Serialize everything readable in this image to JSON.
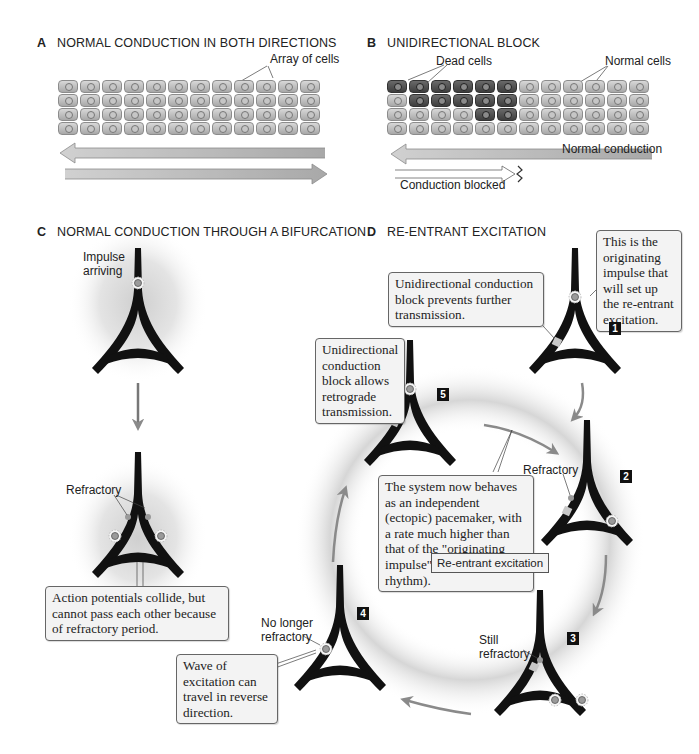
{
  "running_header": "",
  "panels": {
    "A": {
      "letter": "A",
      "title": "NORMAL CONDUCTION IN BOTH DIRECTIONS",
      "labels": {
        "array_of_cells": "Array of cells"
      },
      "grid": {
        "rows": 4,
        "cols": 12
      }
    },
    "B": {
      "letter": "B",
      "title": "UNIDIRECTIONAL BLOCK",
      "labels": {
        "dead_cells": "Dead cells",
        "normal_cells": "Normal cells",
        "normal_conduction": "Normal conduction",
        "conduction_blocked": "Conduction blocked"
      },
      "grid": {
        "rows": 4,
        "cols": 12
      },
      "dead_cells_map": [
        [
          1,
          1,
          1,
          1,
          1,
          1,
          0,
          0,
          0,
          0,
          0,
          0
        ],
        [
          0,
          1,
          1,
          1,
          1,
          1,
          0,
          0,
          0,
          0,
          0,
          0
        ],
        [
          0,
          0,
          0,
          0,
          1,
          1,
          0,
          0,
          0,
          0,
          0,
          0
        ],
        [
          0,
          0,
          0,
          0,
          0,
          0,
          0,
          0,
          0,
          0,
          0,
          0
        ]
      ]
    },
    "C": {
      "letter": "C",
      "title": "NORMAL CONDUCTION THROUGH A BIFURCATION",
      "labels": {
        "impulse_arriving": "Impulse\narriving",
        "refractory": "Refractory"
      },
      "callout": "Action potentials collide, but cannot pass each other because of refractory period."
    },
    "D": {
      "letter": "D",
      "title": "RE-ENTRANT EXCITATION",
      "callouts": {
        "originating": "This is the originating impulse that will set up the re-entrant excitation.",
        "block_prevents": "Unidirectional conduction block prevents further transmission.",
        "block_allows": "Unidirectional conduction block allows retrograde transmission.",
        "system_now": "The system now behaves as an independent (ectopic) pacemaker, with a rate much higher than that of the \"originating impulse\" (i.e., sinus rhythm).",
        "wave": "Wave of excitation can travel in reverse direction."
      },
      "labels": {
        "refractory": "Refractory",
        "still_refractory": "Still\nrefractory",
        "no_longer_refractory": "No longer\nrefractory",
        "re_entrant": "Re-entrant\nexcitation"
      },
      "steps": [
        "1",
        "2",
        "3",
        "4",
        "5"
      ]
    }
  },
  "colors": {
    "fiber": "#111111",
    "arrow_gray": "#8a8a8a",
    "cell_normal": "#bdbdbd",
    "cell_dead": "#4a4a4a",
    "callout_bg": "#f3f3f3",
    "block_patch": "#c8c8c8"
  }
}
